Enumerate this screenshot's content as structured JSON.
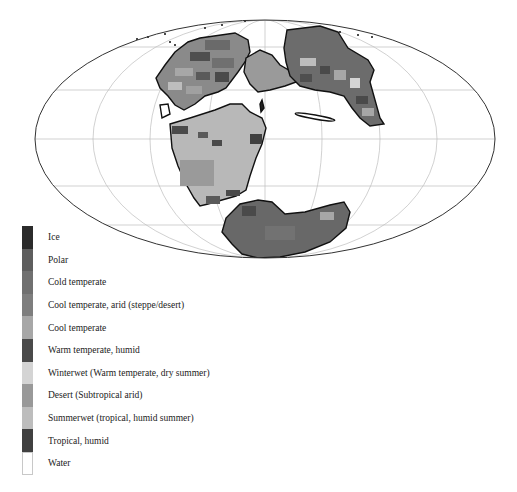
{
  "map": {
    "projection": "mollweide",
    "ellipse": {
      "cx": 265,
      "cy": 139,
      "rx": 230,
      "ry": 119
    },
    "grid_color": "#bdbdbd",
    "outline_color": "#333333",
    "coast_color": "#111111"
  },
  "legend": {
    "items": [
      {
        "label": "Ice",
        "color": "#2b2b2b"
      },
      {
        "label": "Polar",
        "color": "#5e5e5e"
      },
      {
        "label": "Cold temperate",
        "color": "#707070"
      },
      {
        "label": "Cool temperate, arid (steppe/desert)",
        "color": "#7e7e7e"
      },
      {
        "label": "Cool temperate",
        "color": "#a7a7a7"
      },
      {
        "label": "Warm temperate, humid",
        "color": "#4a4a4a"
      },
      {
        "label": "Winterwet (Warm temperate, dry summer)",
        "color": "#d4d4d4"
      },
      {
        "label": "Desert (Subtropical arid)",
        "color": "#999999"
      },
      {
        "label": "Summerwet (tropical, humid summer)",
        "color": "#bdbdbd"
      },
      {
        "label": "Tropical, humid",
        "color": "#404040"
      },
      {
        "label": "Water",
        "color": "#ffffff"
      }
    ]
  }
}
